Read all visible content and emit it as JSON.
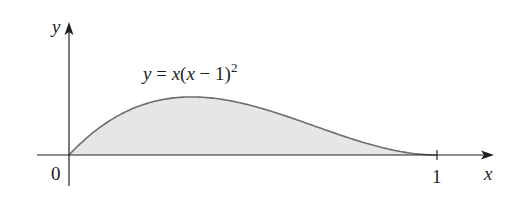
{
  "figure": {
    "equation": {
      "lhs": "y",
      "eq": " = ",
      "rhs_x": "x",
      "rhs_open": "(",
      "rhs_x2": "x",
      "rhs_minus": " − 1)",
      "exponent": "2"
    },
    "axes": {
      "x_label": "x",
      "y_label": "y",
      "origin_label": "0",
      "x_tick_label": "1"
    },
    "colors": {
      "axis": "#231f20",
      "curve": "#6d6d6d",
      "fill": "#e6e6e6"
    }
  },
  "chart_data": {
    "type": "area",
    "xlabel": "x",
    "ylabel": "y",
    "x_ticks": [
      "0",
      "1"
    ],
    "xlim": [
      0,
      1
    ],
    "function": "x*(x-1)^2",
    "shaded_region": {
      "from": 0,
      "to": 1,
      "description": "area under curve between x=0 and x=1"
    },
    "x": [
      0,
      0.1,
      0.2,
      0.3333,
      0.4,
      0.5,
      0.6,
      0.7,
      0.8,
      0.9,
      1.0
    ],
    "values": [
      0,
      0.081,
      0.128,
      0.148,
      0.144,
      0.125,
      0.096,
      0.063,
      0.032,
      0.009,
      0
    ]
  }
}
